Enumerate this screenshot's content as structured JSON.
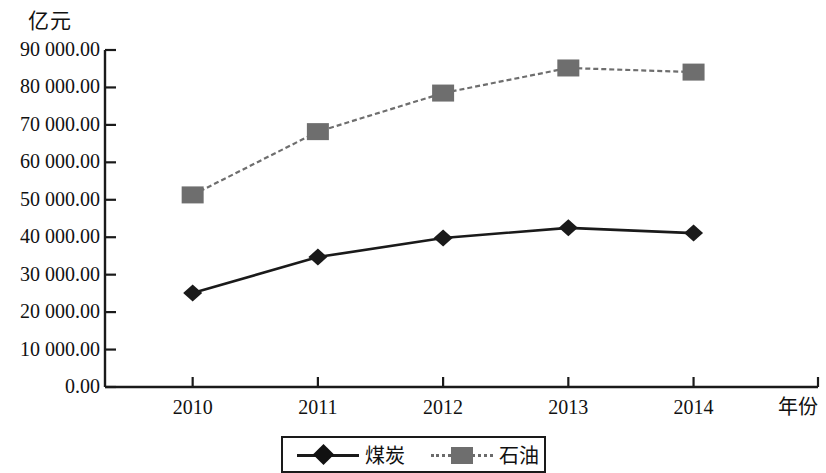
{
  "chart_data": {
    "type": "line",
    "title": "",
    "subtitle": "",
    "ylabel": "亿元",
    "xlabel": "年份",
    "categories": [
      "2010",
      "2011",
      "2012",
      "2013",
      "2014"
    ],
    "ytick_labels": [
      "90 000.00",
      "80 000.00",
      "70 000.00",
      "60 000.00",
      "50 000.00",
      "40 000.00",
      "30 000.00",
      "20 000.00",
      "10 000.00",
      "0.00"
    ],
    "ytick_values": [
      90000,
      80000,
      70000,
      60000,
      50000,
      40000,
      30000,
      20000,
      10000,
      0
    ],
    "ylim": [
      0,
      90000
    ],
    "grid": false,
    "legend_position": "bottom",
    "series": [
      {
        "name": "煤炭",
        "marker": "diamond",
        "color": "#1a1a1a",
        "line_style": "solid",
        "values": [
          25100,
          34700,
          39800,
          42500,
          41100
        ]
      },
      {
        "name": "石油",
        "marker": "square",
        "color": "#6e6e6e",
        "line_style": "dotted",
        "values": [
          51300,
          68200,
          78500,
          85200,
          84100
        ]
      }
    ]
  },
  "axis": {
    "unit_label": "亿元",
    "x_axis_title": "年份"
  },
  "legend": {
    "items": [
      {
        "label": "煤炭"
      },
      {
        "label": "石油"
      }
    ]
  }
}
